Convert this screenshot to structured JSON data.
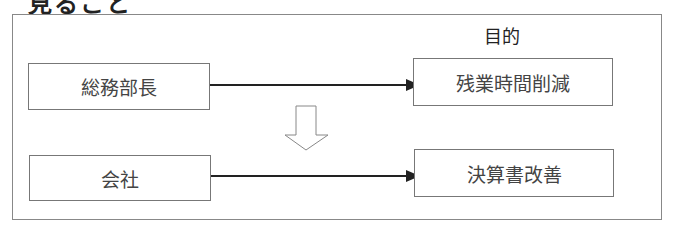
{
  "heading": "見ること",
  "diagram": {
    "column_label": "目的",
    "rows": [
      {
        "source": "総務部長",
        "target": "残業時間削減"
      },
      {
        "source": "会社",
        "target": "決算書改善"
      }
    ],
    "transition": "down-arrow"
  }
}
